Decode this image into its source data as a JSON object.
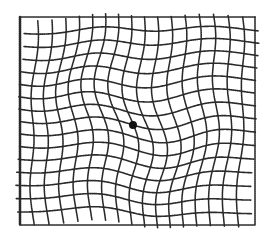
{
  "figure": {
    "type": "amsler-grid-distorted",
    "grid": {
      "left": 20,
      "top": 17,
      "right": 255,
      "bottom": 225,
      "columns": 17,
      "rows": 16,
      "line_color": "#2a2a2a",
      "background": "#ffffff"
    },
    "fixation_dot": {
      "cx": 133,
      "cy": 125,
      "r": 4,
      "color": "#111111"
    },
    "distortion": {
      "center_x": 135,
      "center_y": 120,
      "strength": 7
    }
  }
}
